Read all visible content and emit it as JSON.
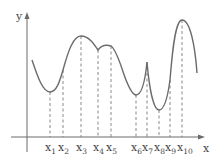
{
  "diagram": {
    "axes": {
      "x_label": "x",
      "y_label": "y"
    },
    "points": [
      {
        "base": "x",
        "sub": "1",
        "px": 50,
        "py": 92
      },
      {
        "base": "x",
        "sub": "2",
        "px": 63,
        "py": 70
      },
      {
        "base": "x",
        "sub": "3",
        "px": 81,
        "py": 36
      },
      {
        "base": "x",
        "sub": "4",
        "px": 98,
        "py": 50
      },
      {
        "base": "x",
        "sub": "5",
        "px": 111,
        "py": 46
      },
      {
        "base": "x",
        "sub": "6",
        "px": 136,
        "py": 95
      },
      {
        "base": "x",
        "sub": "7",
        "px": 147,
        "py": 62
      },
      {
        "base": "x",
        "sub": "8",
        "px": 159,
        "py": 110
      },
      {
        "base": "x",
        "sub": "9",
        "px": 170,
        "py": 80
      },
      {
        "base": "x",
        "sub": "10",
        "px": 182,
        "py": 20
      }
    ],
    "colors": {
      "line": "#6b6b6b",
      "text": "#444444"
    }
  }
}
